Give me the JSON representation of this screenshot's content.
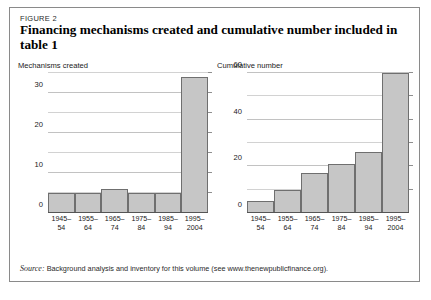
{
  "figure": {
    "label": "FIGURE 2",
    "title": "Financing mechanisms created and cumulative number included in table 1",
    "source": "Background analysis and inventory for this volume (see www.thenewpublicfinance.org).",
    "source_prefix": "Source:"
  },
  "colors": {
    "bar_fill": "#c6c6c6",
    "bar_border": "#6f6f6f",
    "gridline": "#d2d2d2",
    "axis": "#555555",
    "frame": "#8a8a8a"
  },
  "chart_data": [
    {
      "type": "bar",
      "title": "Mechanisms created",
      "xlabel": "",
      "ylabel": "",
      "categories": [
        "1945-54",
        "1955-64",
        "1965-74",
        "1975-84",
        "1985-94",
        "1995-2004"
      ],
      "categories_line1": [
        "1945–",
        "1955–",
        "1965–",
        "1975–",
        "1985–",
        "1995–"
      ],
      "categories_line2": [
        "54",
        "64",
        "74",
        "84",
        "94",
        "2004"
      ],
      "values": [
        5,
        5,
        6,
        5,
        5,
        34
      ],
      "ylim": [
        0,
        35
      ],
      "yticks": [
        0,
        10,
        20,
        30
      ],
      "ytick_labels": [
        "0",
        "10",
        "20",
        "30"
      ],
      "gridline_interval": 5,
      "grid": true,
      "legend": "none"
    },
    {
      "type": "bar",
      "title": "Cumulative number",
      "xlabel": "",
      "ylabel": "",
      "categories": [
        "1945-54",
        "1955-64",
        "1965-74",
        "1975-84",
        "1985-94",
        "1995-2004"
      ],
      "categories_line1": [
        "1945–",
        "1955–",
        "1965–",
        "1975–",
        "1985–",
        "1995–"
      ],
      "categories_line2": [
        "54",
        "64",
        "74",
        "84",
        "94",
        "2004"
      ],
      "values": [
        5,
        10,
        17,
        21,
        26,
        60
      ],
      "ylim": [
        0,
        60
      ],
      "yticks": [
        0,
        20,
        40,
        60
      ],
      "ytick_labels": [
        "0",
        "20",
        "40",
        "60"
      ],
      "gridline_interval": 10,
      "grid": true,
      "legend": "none"
    }
  ]
}
